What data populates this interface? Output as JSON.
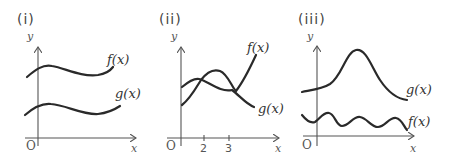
{
  "panels": [
    {
      "label": "(i)",
      "y_axis_label": "y",
      "x_axis_label": "x",
      "origin_label": "O",
      "curves": [
        {
          "name": "f(x)",
          "label": "f(x)",
          "shape": "gentle wave, upper"
        },
        {
          "name": "g(x)",
          "label": "g(x)",
          "shape": "gentle wave, lower, parallel to f"
        }
      ],
      "ticks": []
    },
    {
      "label": "(ii)",
      "y_axis_label": "y",
      "x_axis_label": "x",
      "origin_label": "O",
      "curves": [
        {
          "name": "f(x)",
          "label": "f(x)",
          "shape": "rises to a peak, dips, then rises steeply"
        },
        {
          "name": "g(x)",
          "label": "g(x)",
          "shape": "small hump then decreasing"
        }
      ],
      "ticks": [
        "2",
        "3"
      ],
      "intersections_x": [
        "2",
        "3"
      ]
    },
    {
      "label": "(iii)",
      "y_axis_label": "y",
      "x_axis_label": "x",
      "origin_label": "O",
      "curves": [
        {
          "name": "g(x)",
          "label": "g(x)",
          "shape": "bell-shaped peak, upper"
        },
        {
          "name": "f(x)",
          "label": "f(x)",
          "shape": "oscillating wave, lower"
        }
      ],
      "ticks": []
    }
  ],
  "colors": {
    "curve": "#2a2a2a",
    "axis": "#555555",
    "background": "#ffffff"
  }
}
